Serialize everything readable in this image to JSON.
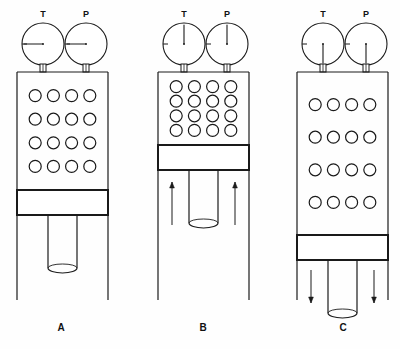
{
  "figure": {
    "title": "",
    "type": "gas-law-piston-diagram",
    "background": "#ffffff",
    "stroke": "#1a1a1a",
    "panel_count": 3
  },
  "gauge_labels": {
    "temperature": "T",
    "pressure": "P"
  },
  "panels": [
    {
      "id": "A",
      "label": "A",
      "label_x": 61,
      "label_y": 331,
      "cylinder": {
        "x": 17,
        "y": 72,
        "width": 91,
        "height": 228
      },
      "gas_region": {
        "x": 17,
        "y": 72,
        "width": 91,
        "height": 118
      },
      "piston_plate": {
        "x": 17,
        "y": 190,
        "width": 91,
        "height": 25
      },
      "piston_rod": {
        "x": 48,
        "y": 215,
        "width": 29,
        "height": 58
      },
      "molecule_grid": {
        "rows": 4,
        "cols": 4,
        "radius": 6,
        "count": 16
      },
      "gauges": [
        {
          "name": "T",
          "cx": 43,
          "cy": 44,
          "r": 21,
          "needle_angle_deg": 180,
          "stem_x": 43
        },
        {
          "name": "P",
          "cx": 86,
          "cy": 44,
          "r": 21,
          "needle_angle_deg": 180,
          "stem_x": 86
        }
      ],
      "arrows": []
    },
    {
      "id": "B",
      "label": "B",
      "label_x": 203,
      "label_y": 331,
      "cylinder": {
        "x": 158,
        "y": 72,
        "width": 91,
        "height": 228
      },
      "gas_region": {
        "x": 158,
        "y": 72,
        "width": 91,
        "height": 73
      },
      "piston_plate": {
        "x": 158,
        "y": 145,
        "width": 91,
        "height": 25
      },
      "piston_rod": {
        "x": 189,
        "y": 170,
        "width": 29,
        "height": 58
      },
      "molecule_grid": {
        "rows": 4,
        "cols": 4,
        "radius": 6,
        "count": 16
      },
      "gauges": [
        {
          "name": "T",
          "cx": 184,
          "cy": 44,
          "r": 21,
          "needle_angle_deg": 270,
          "stem_x": 184
        },
        {
          "name": "P",
          "cx": 227,
          "cy": 44,
          "r": 21,
          "needle_angle_deg": 270,
          "stem_x": 227
        }
      ],
      "arrows": [
        {
          "direction": "up",
          "x": 172,
          "y_tail": 225,
          "y_head": 182
        },
        {
          "direction": "up",
          "x": 235,
          "y_tail": 225,
          "y_head": 182
        }
      ]
    },
    {
      "id": "C",
      "label": "C",
      "label_x": 343,
      "label_y": 331,
      "cylinder": {
        "x": 297,
        "y": 72,
        "width": 91,
        "height": 228
      },
      "gas_region": {
        "x": 297,
        "y": 72,
        "width": 91,
        "height": 163
      },
      "piston_plate": {
        "x": 297,
        "y": 235,
        "width": 91,
        "height": 25
      },
      "piston_rod": {
        "x": 328,
        "y": 260,
        "width": 29,
        "height": 58
      },
      "molecule_grid": {
        "rows": 4,
        "cols": 4,
        "radius": 6,
        "count": 16
      },
      "gauges": [
        {
          "name": "T",
          "cx": 323,
          "cy": 44,
          "r": 21,
          "needle_angle_deg": 90,
          "stem_x": 323
        },
        {
          "name": "P",
          "cx": 366,
          "cy": 44,
          "r": 21,
          "needle_angle_deg": 90,
          "stem_x": 366
        }
      ],
      "arrows": [
        {
          "direction": "down",
          "x": 311,
          "y_tail": 270,
          "y_head": 303
        },
        {
          "direction": "down",
          "x": 374,
          "y_tail": 270,
          "y_head": 303
        }
      ]
    }
  ]
}
